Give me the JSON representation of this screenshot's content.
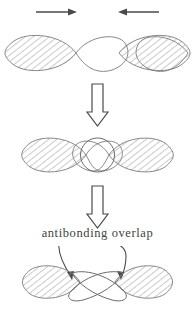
{
  "diagram": {
    "title_text": "antibonding overlap",
    "colors": {
      "stroke": "#5a5a5a",
      "hatch": "#9a9a9a",
      "arrow": "#4a4a4a",
      "background": "#ffffff",
      "text": "#3f3f3f"
    },
    "stages": [
      {
        "name": "approach",
        "description": "two p-orbitals approaching",
        "orbitals": 2,
        "arrows": [
          {
            "name": "left-approach-arrow",
            "direction": "right"
          },
          {
            "name": "right-approach-arrow",
            "direction": "left"
          }
        ]
      },
      {
        "name": "contact",
        "description": "inner lobes meet forming circular overlap region",
        "orbitals": 2
      },
      {
        "name": "antibonding",
        "description": "inner lobes cross forming antibonding overlap",
        "orbitals": 2
      }
    ],
    "transition_arrows": [
      {
        "name": "transition-arrow-1",
        "direction": "down",
        "style": "hollow-outline"
      },
      {
        "name": "transition-arrow-2",
        "direction": "down",
        "style": "hollow-outline"
      }
    ],
    "callout": {
      "label": "antibonding overlap",
      "leader_lines": 2
    }
  }
}
